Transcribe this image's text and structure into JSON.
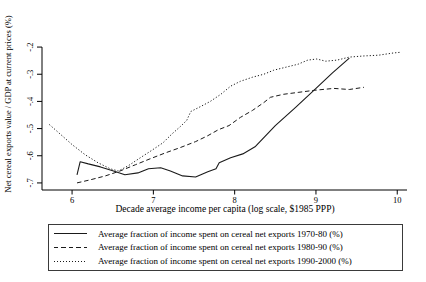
{
  "colors": {
    "line": "#1a1a1a",
    "axis": "#000000",
    "text": "#000000",
    "background": "#ffffff"
  },
  "legend": {
    "items": [
      {
        "style": "solid",
        "label": "Average fraction of income spent on cereal net exports 1970-80 (%)"
      },
      {
        "style": "dashed",
        "label": "Average fraction of income spent on cereal net exports 1980-90 (%)"
      },
      {
        "style": "dotted",
        "label": "Average fraction of income spent on cereal net exports 1990-2000 (%)"
      }
    ]
  },
  "chart_data": {
    "type": "line",
    "title": "",
    "xlabel": "Decade average income per capita (log scale, $1985 PPP)",
    "ylabel": "Net cereal exports value / GDP at current prices (%)",
    "xlim": [
      5.63,
      10.12
    ],
    "ylim": [
      -0.726,
      -0.174
    ],
    "grid": false,
    "legend_position": "bottom",
    "x_ticks": [
      {
        "value": 6,
        "label": "6"
      },
      {
        "value": 7,
        "label": "7"
      },
      {
        "value": 8,
        "label": "8"
      },
      {
        "value": 9,
        "label": "9"
      },
      {
        "value": 10,
        "label": "10"
      }
    ],
    "y_ticks": [
      {
        "value": -0.2,
        "label": "-.2"
      },
      {
        "value": -0.3,
        "label": "-.3"
      },
      {
        "value": -0.4,
        "label": "-.4"
      },
      {
        "value": -0.5,
        "label": "-.5"
      },
      {
        "value": -0.6,
        "label": "-.6"
      },
      {
        "value": -0.7,
        "label": "-.7"
      }
    ],
    "series": [
      {
        "name": "Average fraction of income spent on cereal net exports 1970-80 (%)",
        "line_style": "solid",
        "color": "#1a1a1a",
        "points": [
          [
            6.06,
            -0.67
          ],
          [
            6.1,
            -0.622
          ],
          [
            6.2,
            -0.63
          ],
          [
            6.35,
            -0.641
          ],
          [
            6.51,
            -0.656
          ],
          [
            6.65,
            -0.67
          ],
          [
            6.81,
            -0.663
          ],
          [
            6.94,
            -0.648
          ],
          [
            7.09,
            -0.644
          ],
          [
            7.21,
            -0.656
          ],
          [
            7.36,
            -0.674
          ],
          [
            7.52,
            -0.678
          ],
          [
            7.67,
            -0.659
          ],
          [
            7.77,
            -0.648
          ],
          [
            7.81,
            -0.626
          ],
          [
            7.95,
            -0.607
          ],
          [
            8.1,
            -0.593
          ],
          [
            8.25,
            -0.567
          ],
          [
            8.5,
            -0.489
          ],
          [
            8.75,
            -0.422
          ],
          [
            9.0,
            -0.352
          ],
          [
            9.2,
            -0.296
          ],
          [
            9.41,
            -0.241
          ]
        ]
      },
      {
        "name": "Average fraction of income spent on cereal net exports 1980-90 (%)",
        "line_style": "dashed",
        "color": "#1a1a1a",
        "points": [
          [
            6.06,
            -0.7
          ],
          [
            6.22,
            -0.689
          ],
          [
            6.41,
            -0.674
          ],
          [
            6.59,
            -0.656
          ],
          [
            6.78,
            -0.633
          ],
          [
            6.96,
            -0.611
          ],
          [
            7.15,
            -0.589
          ],
          [
            7.33,
            -0.57
          ],
          [
            7.52,
            -0.548
          ],
          [
            7.67,
            -0.526
          ],
          [
            7.8,
            -0.504
          ],
          [
            7.93,
            -0.489
          ],
          [
            8.07,
            -0.459
          ],
          [
            8.22,
            -0.433
          ],
          [
            8.36,
            -0.404
          ],
          [
            8.44,
            -0.385
          ],
          [
            8.6,
            -0.374
          ],
          [
            8.78,
            -0.367
          ],
          [
            8.98,
            -0.359
          ],
          [
            9.22,
            -0.352
          ],
          [
            9.41,
            -0.356
          ],
          [
            9.59,
            -0.348
          ]
        ]
      },
      {
        "name": "Average fraction of income spent on cereal net exports 1990-2000 (%)",
        "line_style": "dotted",
        "color": "#1a1a1a",
        "points": [
          [
            5.72,
            -0.485
          ],
          [
            5.85,
            -0.519
          ],
          [
            6.0,
            -0.559
          ],
          [
            6.16,
            -0.596
          ],
          [
            6.32,
            -0.626
          ],
          [
            6.47,
            -0.648
          ],
          [
            6.57,
            -0.656
          ],
          [
            6.69,
            -0.637
          ],
          [
            6.84,
            -0.607
          ],
          [
            6.99,
            -0.578
          ],
          [
            7.12,
            -0.552
          ],
          [
            7.23,
            -0.519
          ],
          [
            7.33,
            -0.493
          ],
          [
            7.41,
            -0.47
          ],
          [
            7.46,
            -0.437
          ],
          [
            7.58,
            -0.419
          ],
          [
            7.7,
            -0.4
          ],
          [
            7.83,
            -0.374
          ],
          [
            7.95,
            -0.344
          ],
          [
            8.07,
            -0.326
          ],
          [
            8.22,
            -0.311
          ],
          [
            8.36,
            -0.3
          ],
          [
            8.48,
            -0.285
          ],
          [
            8.63,
            -0.274
          ],
          [
            8.78,
            -0.263
          ],
          [
            8.9,
            -0.248
          ],
          [
            9.01,
            -0.244
          ],
          [
            9.12,
            -0.252
          ],
          [
            9.26,
            -0.248
          ],
          [
            9.41,
            -0.237
          ],
          [
            9.58,
            -0.233
          ],
          [
            9.77,
            -0.23
          ],
          [
            9.95,
            -0.222
          ],
          [
            10.05,
            -0.219
          ]
        ]
      }
    ]
  }
}
